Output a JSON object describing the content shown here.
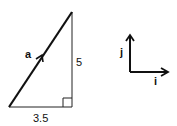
{
  "triangle": {
    "vector_label": "a",
    "vertical_side": "5",
    "horizontal_side": "3.5",
    "right_angle": true
  },
  "unit_vectors": {
    "vertical_label": "j",
    "horizontal_label": "i"
  }
}
